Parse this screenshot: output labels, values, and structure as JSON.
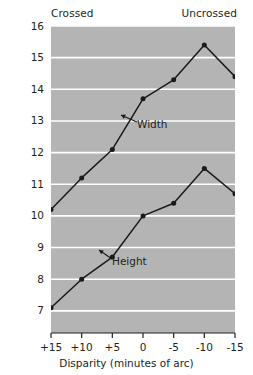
{
  "chart_data": {
    "type": "line",
    "title": "",
    "xlabel": "Disparity (minutes of arc)",
    "ylabel": "Mean height and width",
    "x": [
      15,
      10,
      5,
      0,
      -5,
      -10,
      -15
    ],
    "xticklabels": [
      "+15",
      "+10",
      "+5",
      "0",
      "-5",
      "-10",
      "-15"
    ],
    "xlim": [
      15,
      -15
    ],
    "ylim": [
      6.3,
      16
    ],
    "yticks": [
      7,
      8,
      9,
      10,
      11,
      12,
      13,
      14,
      15,
      16
    ],
    "yticklabels": [
      "7",
      "8",
      "9",
      "10",
      "11",
      "12",
      "13",
      "14",
      "15",
      "16"
    ],
    "grid": true,
    "grid_color": "#ffffff",
    "plot_background": "#b4b4b4",
    "line_color": "#1a1a1a",
    "marker": "circle",
    "legend": "annotations",
    "series": [
      {
        "name": "Width",
        "values": [
          10.2,
          11.2,
          12.1,
          13.7,
          14.3,
          15.4,
          14.4
        ]
      },
      {
        "name": "Height",
        "values": [
          7.1,
          8.0,
          8.7,
          10.0,
          10.4,
          11.5,
          10.7
        ]
      }
    ],
    "annotations": [
      {
        "text": "Width",
        "series": "Width"
      },
      {
        "text": "Height",
        "series": "Height"
      }
    ],
    "axis_headers": {
      "left": "Crossed",
      "right": "Uncrossed"
    }
  }
}
